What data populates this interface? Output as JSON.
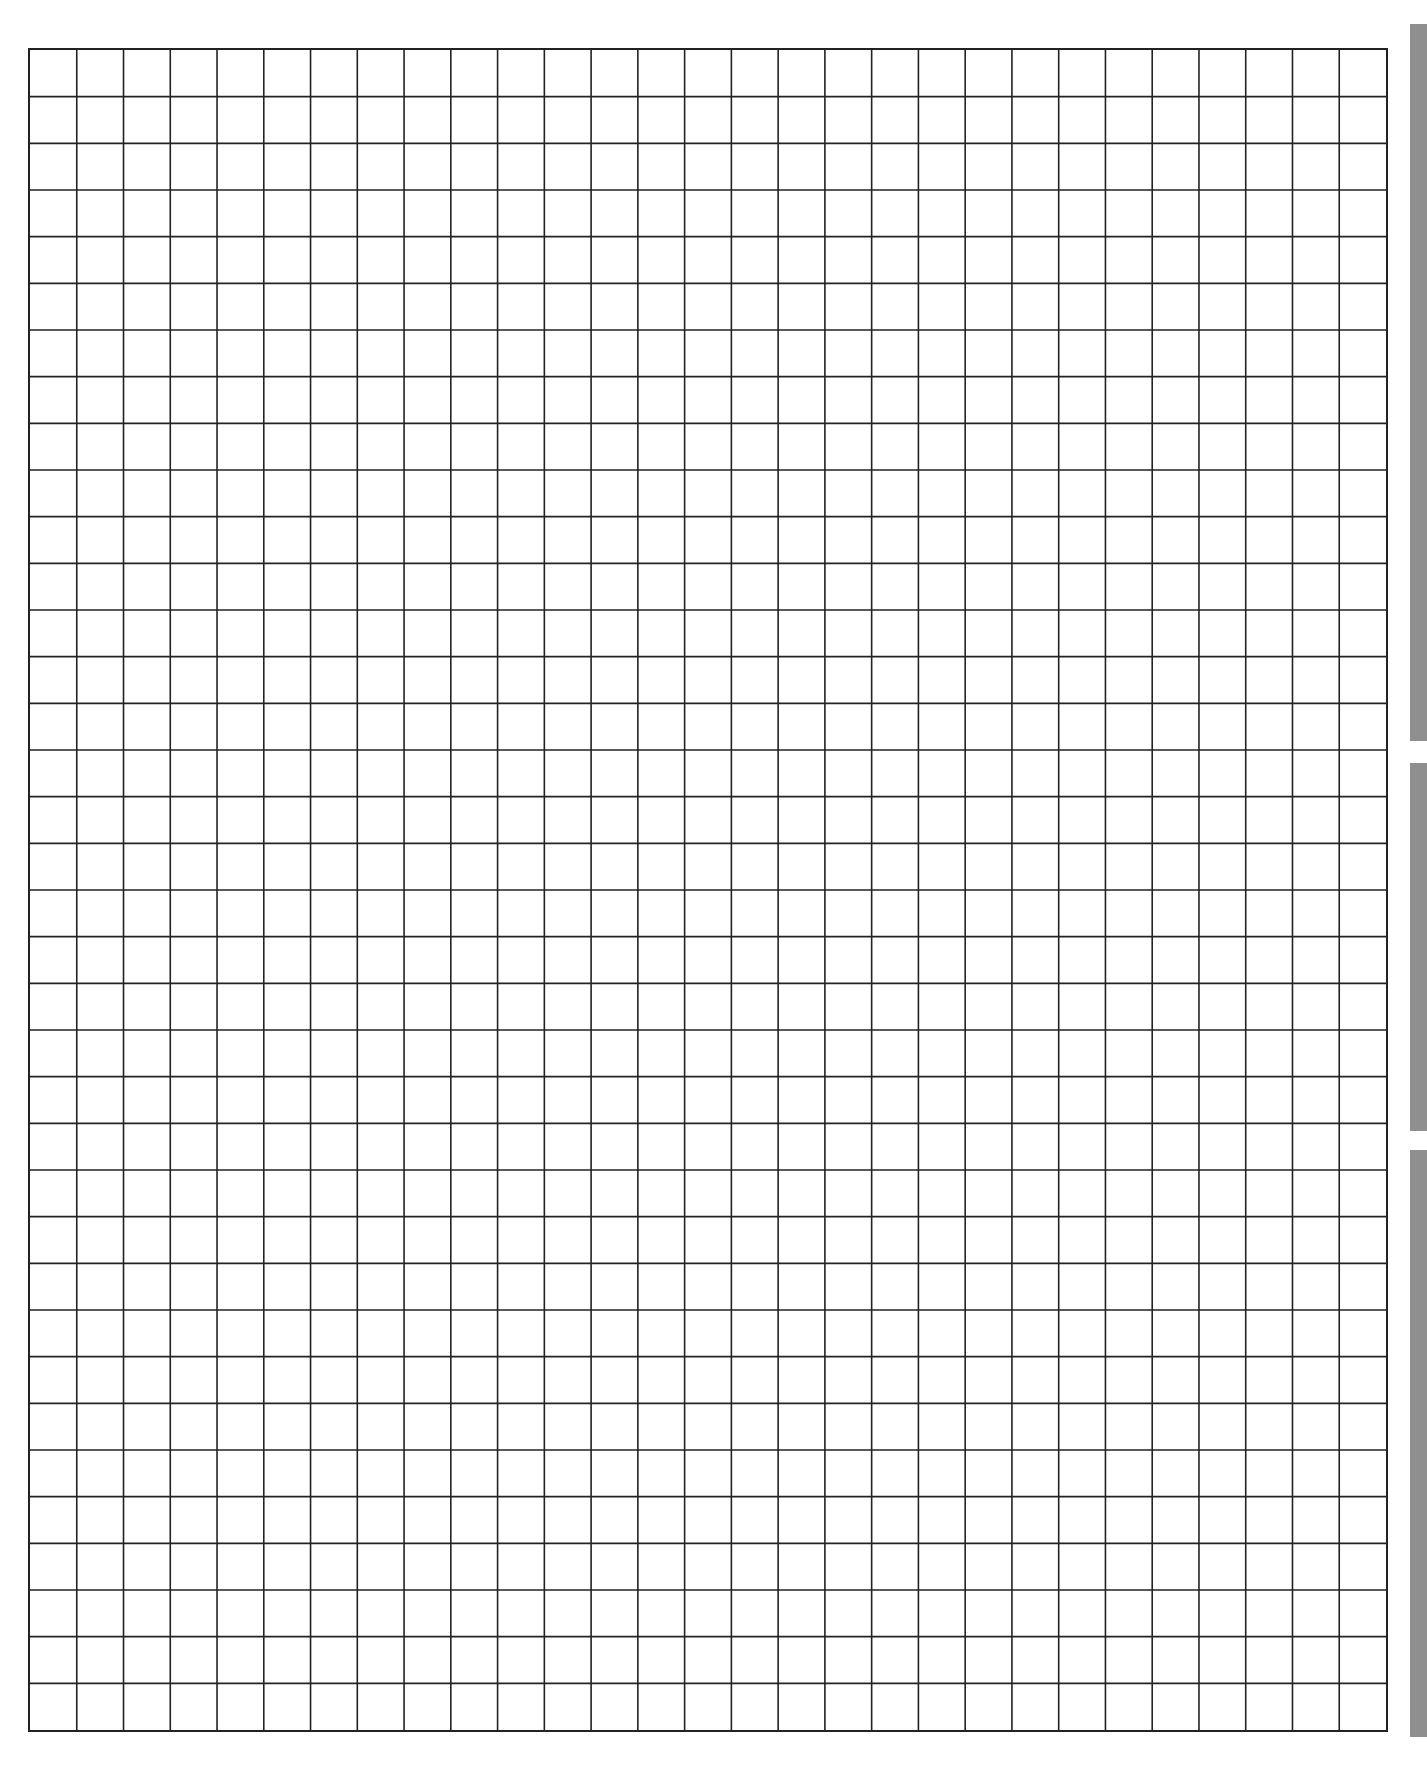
{
  "document": {
    "type": "graph-paper",
    "grid": {
      "columns": 29,
      "rows": 36,
      "line_color": "#222222",
      "background": "#ffffff"
    },
    "side_tabs": [
      {
        "top": 24,
        "height": 717,
        "color": "#8f8f8f"
      },
      {
        "top": 763,
        "height": 368,
        "color": "#8f8f8f"
      },
      {
        "top": 1150,
        "height": 587,
        "color": "#8f8f8f"
      }
    ]
  }
}
